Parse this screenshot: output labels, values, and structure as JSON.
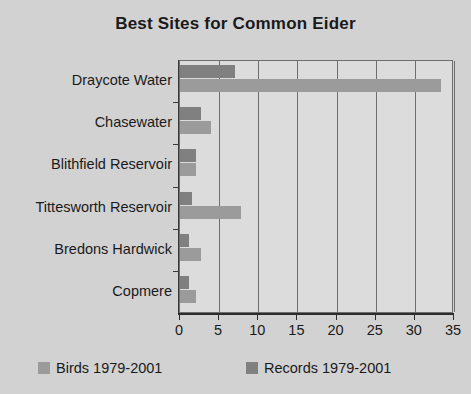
{
  "chart_data": {
    "type": "bar",
    "orientation": "horizontal",
    "title": "Best Sites for Common Eider",
    "xlabel": "",
    "ylabel": "",
    "categories": [
      "Draycote Water",
      "Chasewater",
      "Blithfield Reservoir",
      "Tittesworth Reservoir",
      "Bredons Hardwick",
      "Copmere"
    ],
    "series": [
      {
        "name": "Birds 1979-2001",
        "color": "#9b9b9b",
        "values": [
          33.3,
          4.0,
          2.1,
          7.8,
          2.7,
          2.0
        ]
      },
      {
        "name": "Records 1979-2001",
        "color": "#808080",
        "values": [
          7.0,
          2.7,
          2.1,
          1.5,
          1.2,
          1.2
        ]
      }
    ],
    "xlim": [
      0,
      35
    ],
    "xticks": [
      0,
      5,
      10,
      15,
      20,
      25,
      30,
      35
    ],
    "xtick_labels": [
      "0",
      "5",
      "10",
      "15",
      "20",
      "25",
      "30",
      "35"
    ],
    "grid": true,
    "grid_axis": "x",
    "legend_position": "bottom",
    "background_color": "#d2d2d2",
    "plot_background_color": "#dcdcdc",
    "axis_color": "#2c2c2c"
  }
}
